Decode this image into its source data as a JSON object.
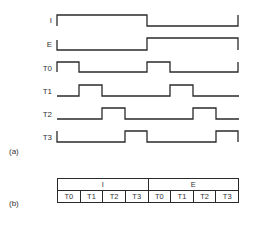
{
  "diagram": {
    "part_a_label": "(a)",
    "part_b_label": "(b)",
    "signals": [
      {
        "name": "I",
        "levels": [
          1,
          1,
          1,
          1,
          0,
          0,
          0,
          0
        ]
      },
      {
        "name": "E",
        "levels": [
          0,
          0,
          0,
          0,
          1,
          1,
          1,
          1
        ]
      },
      {
        "name": "T0",
        "levels": [
          1,
          0,
          0,
          0,
          1,
          0,
          0,
          0
        ]
      },
      {
        "name": "T1",
        "levels": [
          0,
          1,
          0,
          0,
          0,
          1,
          0,
          0
        ]
      },
      {
        "name": "T2",
        "levels": [
          0,
          0,
          1,
          0,
          0,
          0,
          1,
          0
        ]
      },
      {
        "name": "T3",
        "levels": [
          0,
          0,
          0,
          1,
          0,
          0,
          0,
          1
        ]
      }
    ],
    "table": {
      "phases": [
        "I",
        "E"
      ],
      "states": [
        "T0",
        "T1",
        "T2",
        "T3",
        "T0",
        "T1",
        "T2",
        "T3"
      ]
    },
    "line_color": "#2a2a2a"
  }
}
